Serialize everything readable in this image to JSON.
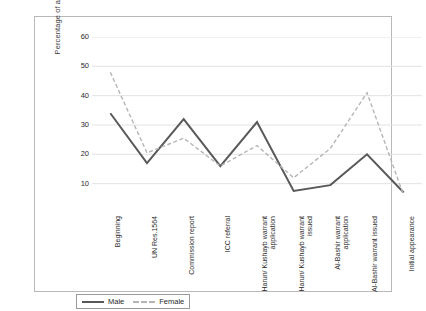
{
  "chart_data": {
    "type": "line",
    "title": "",
    "xlabel": "",
    "ylabel": "Percentage of articles",
    "ylim": [
      0,
      60
    ],
    "yticks": [
      60,
      50,
      40,
      30,
      20,
      10
    ],
    "grid": true,
    "legend_position": "bottom-left",
    "categories": [
      "Beginning",
      "UN Res.1564",
      "Commission report",
      "ICC referral",
      "Harun/ Kushayb warrant application",
      "Harun/ Kushayb warrant issued",
      "Al-Bashir warrant application",
      "Al-Bashir warrant issued",
      "Initial appearance"
    ],
    "series": [
      {
        "name": "Male",
        "style": "solid",
        "color": "#595959",
        "values": [
          34,
          17,
          32,
          16,
          31,
          7.5,
          9.5,
          20,
          7
        ]
      },
      {
        "name": "Female",
        "style": "dashed",
        "color": "#b5b5b5",
        "values": [
          48,
          20.5,
          25.5,
          16,
          23,
          12,
          22,
          41,
          6
        ]
      }
    ]
  },
  "legend": {
    "items": [
      {
        "label": "Male"
      },
      {
        "label": "Female"
      }
    ]
  },
  "colors": {
    "male_line": "#595959",
    "female_line": "#b5b5b5",
    "gridline": "#e2e2e2",
    "frame_border": "#b8b8b8",
    "text": "#2b2b2b"
  }
}
